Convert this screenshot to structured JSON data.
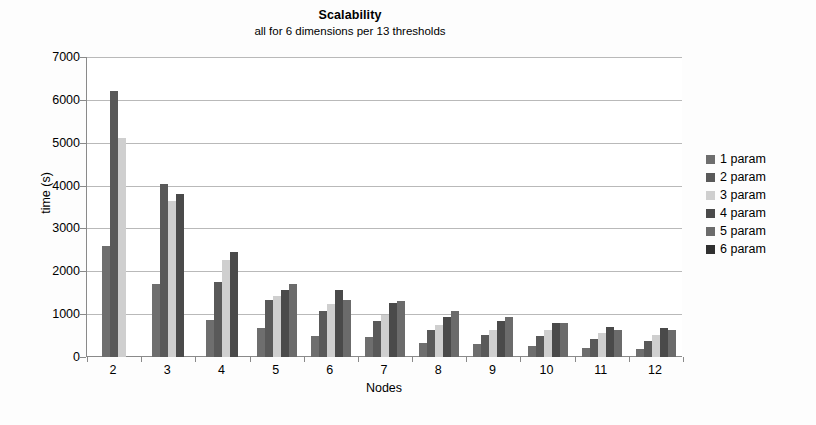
{
  "chart_data": {
    "type": "bar",
    "title": "Scalability",
    "subtitle": "all for 6 dimensions per 13 thresholds",
    "xlabel": "Nodes",
    "ylabel": "time (s)",
    "ylim": [
      0,
      7000
    ],
    "ytick_step": 1000,
    "yticks": [
      7000,
      6000,
      5000,
      4000,
      3000,
      2000,
      1000,
      0
    ],
    "ytick_labels": [
      "7000",
      "6000",
      "5000",
      "4000",
      "3000",
      "2000",
      "1000",
      "0"
    ],
    "categories": [
      "2",
      "3",
      "4",
      "5",
      "6",
      "7",
      "8",
      "9",
      "10",
      "11",
      "12"
    ],
    "grid": true,
    "legend_position": "right",
    "series": [
      {
        "name": "1 param",
        "color": "#6e6e6e",
        "values": [
          2600,
          1700,
          870,
          680,
          500,
          460,
          330,
          300,
          260,
          220,
          180
        ]
      },
      {
        "name": "2 param",
        "color": "#595959",
        "values": [
          6200,
          4030,
          1760,
          1340,
          1080,
          840,
          630,
          520,
          480,
          420,
          380
        ]
      },
      {
        "name": "3 param",
        "color": "#cfcfcf",
        "values": [
          5100,
          3640,
          2270,
          1430,
          1240,
          970,
          740,
          640,
          620,
          560,
          520
        ]
      },
      {
        "name": "4 param",
        "color": "#4a4a4a",
        "values": [
          0,
          3800,
          2440,
          1560,
          1570,
          1250,
          930,
          840,
          790,
          710,
          670
        ]
      },
      {
        "name": "5 param",
        "color": "#6b6b6b",
        "values": [
          0,
          0,
          0,
          1700,
          1320,
          1310,
          1080,
          930,
          800,
          640,
          620
        ]
      },
      {
        "name": "6 param",
        "color": "#303030",
        "values": [
          0,
          0,
          0,
          0,
          0,
          0,
          0,
          0,
          0,
          0,
          0
        ]
      }
    ]
  },
  "legend": {
    "items": [
      {
        "label": "1 param"
      },
      {
        "label": "2 param"
      },
      {
        "label": "3 param"
      },
      {
        "label": "4 param"
      },
      {
        "label": "5 param"
      },
      {
        "label": "6 param"
      }
    ]
  }
}
